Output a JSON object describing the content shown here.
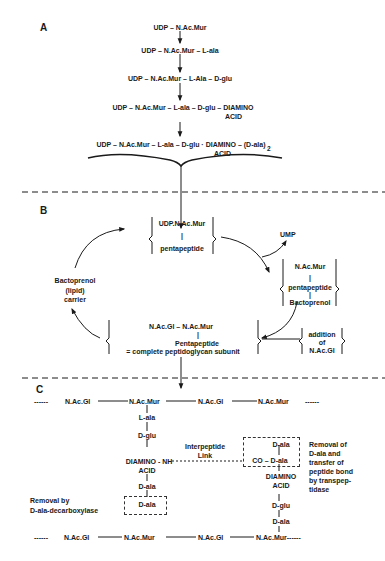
{
  "sections": {
    "A": {
      "label": "A",
      "steps": [
        "UDP – N.Ac.Mur",
        "UDP – N.Ac.Mur – L-ala",
        "UDP – N.Ac.Mur – L-Ala – D-glu",
        "UDP – N.Ac.Mur – L-ala – D-glu – DIAMINO",
        "UDP – N.Ac.Mur – L-ala – D-glu · DIAMINO – (D-ala)"
      ],
      "step4_acid": "ACID",
      "step5_acid": "ACID",
      "step5_subscript": "2"
    },
    "B": {
      "label": "B",
      "udp_box_top": "UDP.N.Ac.Mur",
      "udp_box_bar": "|",
      "udp_box_bottom": "pentapeptide",
      "ump": "UMP",
      "lipid_box_1": "N.Ac.Mur",
      "lipid_box_bar1": "|",
      "lipid_box_2": "pentapeptide",
      "lipid_box_bar2": "|",
      "lipid_box_3": "Bactoprenol",
      "carrier_1": "Bactoprenol",
      "carrier_2": "(lipid)",
      "carrier_3": "carrier",
      "addition_1": "addition",
      "addition_2": "of",
      "addition_3": "N.Ac.Gl",
      "subunit_1": "N.Ac.Gl – N.Ac.Mur",
      "subunit_bar": "|",
      "subunit_2": "Pentapeptide",
      "subunit_3": "= complete peptidoglycan subunit"
    },
    "C": {
      "label": "C",
      "top_chain": [
        "------",
        "N.Ac.Gl",
        "N.Ac.Mur",
        "N.Ac.Gl",
        "N.Ac.Mur",
        "------"
      ],
      "bottom_chain": [
        "------",
        "N.Ac.Gl",
        "N.Ac.Mur",
        "N.Ac.Gl",
        "N.Ac.Mur------"
      ],
      "left_stem": [
        "L-ala",
        "D-glu",
        "DIAMINO - NH",
        "ACID",
        "D-ala",
        "D-ala"
      ],
      "right_stem": [
        "D-ala",
        "CO – D-ala",
        "DIAMINO",
        "ACID",
        "D-glu",
        "D-ala"
      ],
      "interpeptide_1": "Interpeptide",
      "interpeptide_2": "Link",
      "removal_left_1": "Removal by",
      "removal_left_2": "D-ala-decarboxylase",
      "removal_right": [
        "Removal of",
        "D-ala and",
        "transfer of",
        "peptide bond",
        "by transpep-",
        "tidase"
      ]
    }
  },
  "colors": {
    "ink": "#1a1a1a",
    "background": "#ffffff"
  }
}
